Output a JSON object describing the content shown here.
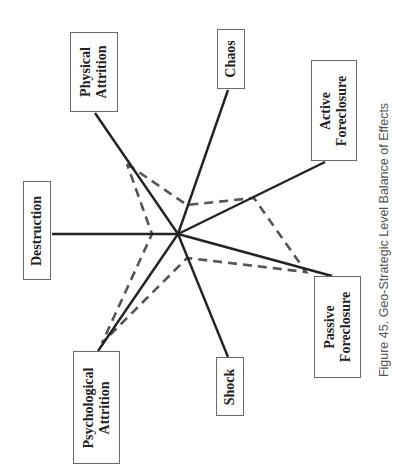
{
  "diagram": {
    "center": [
      178,
      234
    ],
    "spokes": [
      {
        "id": "physical-attrition",
        "label_lines": [
          "Physical",
          "Attrition"
        ],
        "box": [
          70,
          32,
          48,
          80
        ],
        "end": [
          95,
          113
        ],
        "dash_vertex": [
          127,
          164
        ]
      },
      {
        "id": "chaos",
        "label_lines": [
          "Chaos"
        ],
        "box": [
          217,
          29,
          28,
          60
        ],
        "end": [
          228,
          90
        ],
        "dash_vertex": [
          187,
          205
        ]
      },
      {
        "id": "active-foreclosure",
        "label_lines": [
          "Active",
          "Foreclosure"
        ],
        "box": [
          311,
          60,
          46,
          101
        ],
        "end": [
          325,
          162
        ],
        "dash_vertex": [
          254,
          198
        ]
      },
      {
        "id": "passive-foreclosure",
        "label_lines": [
          "Passive",
          "Foreclosure"
        ],
        "box": [
          314,
          276,
          47,
          102
        ],
        "end": [
          332,
          276
        ],
        "dash_vertex": [
          306,
          272
        ]
      },
      {
        "id": "shock",
        "label_lines": [
          "Shock"
        ],
        "box": [
          216,
          357,
          28,
          59
        ],
        "end": [
          228,
          357
        ],
        "dash_vertex": [
          187,
          258
        ]
      },
      {
        "id": "psychological-attrition",
        "label_lines": [
          "Psychological",
          "Attrition"
        ],
        "box": [
          73,
          351,
          47,
          113
        ],
        "end": [
          98,
          351
        ],
        "dash_vertex": [
          102,
          343
        ]
      },
      {
        "id": "destruction",
        "label_lines": [
          "Destruction"
        ],
        "box": [
          23,
          181,
          28,
          99
        ],
        "end": [
          52,
          234
        ],
        "dash_vertex": [
          152,
          234
        ]
      }
    ],
    "dashed_path": [
      [
        127,
        164
      ],
      [
        187,
        205
      ],
      [
        254,
        198
      ],
      [
        306,
        272
      ],
      [
        187,
        258
      ],
      [
        102,
        343
      ],
      [
        152,
        234
      ],
      [
        127,
        164
      ]
    ],
    "colors": {
      "spoke": "#222222",
      "dashed": "#555555",
      "box_border": "#6a6a6a"
    }
  },
  "labels": {
    "physical_attrition": "Physical\nAttrition",
    "chaos": "Chaos",
    "active_foreclosure": "Active\nForeclosure",
    "passive_foreclosure": "Passive\nForeclosure",
    "shock": "Shock",
    "psychological_attrition": "Psychological\nAttrition",
    "destruction": "Destruction"
  },
  "caption": "Figure 45. Geo-Strategic Level Balance of Effects"
}
